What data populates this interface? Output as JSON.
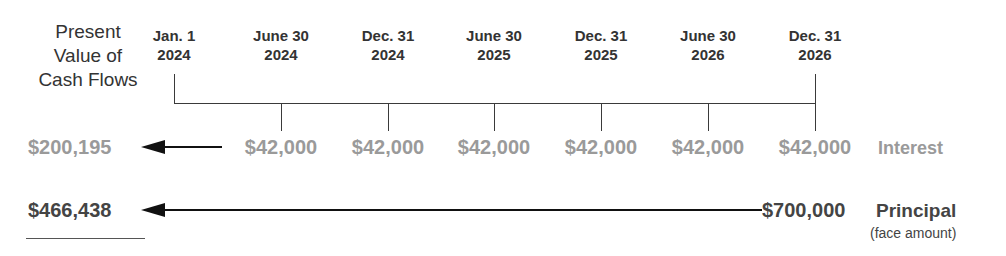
{
  "diagram": {
    "type": "timeline",
    "present_value_label": "Present Value of Cash Flows",
    "present_value_label_lines": [
      "Present",
      "Value of",
      "Cash Flows"
    ],
    "dates": [
      {
        "line1": "Jan. 1",
        "line2": "2024"
      },
      {
        "line1": "June 30",
        "line2": "2024"
      },
      {
        "line1": "Dec. 31",
        "line2": "2024"
      },
      {
        "line1": "June 30",
        "line2": "2025"
      },
      {
        "line1": "Dec. 31",
        "line2": "2025"
      },
      {
        "line1": "June 30",
        "line2": "2026"
      },
      {
        "line1": "Dec. 31",
        "line2": "2026"
      }
    ],
    "interest": {
      "present_value": "$200,195",
      "payments": [
        "$42,000",
        "$42,000",
        "$42,000",
        "$42,000",
        "$42,000",
        "$42,000"
      ],
      "label": "Interest"
    },
    "principal": {
      "present_value": "$466,438",
      "amount": "$700,000",
      "label": "Principal",
      "sublabel": "(face amount)"
    },
    "colors": {
      "interest_text": "#9a9a9a",
      "principal_text": "#444444",
      "lines": "#3a3a3a"
    }
  }
}
